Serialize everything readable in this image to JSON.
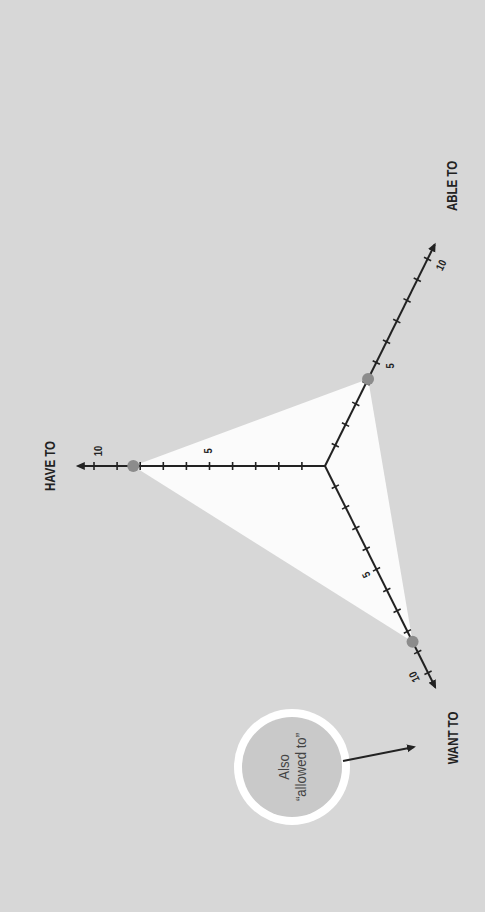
{
  "diagram": {
    "orientation": "rotated -90deg (page is sideways)",
    "background_color": "#d7d7d7",
    "triangle_fill": "#fbfbfb",
    "axis_color": "#222222",
    "point_color": "#8c8c8c",
    "center": [
      325,
      466
    ],
    "px_per_unit": 23.1,
    "axes": [
      {
        "id": "have_to",
        "label": "HAVE TO",
        "direction": [
          -1,
          0
        ],
        "max": 10,
        "value": 8.3,
        "tick_labels": [
          "5",
          "10"
        ]
      },
      {
        "id": "able_to",
        "label": "ABLE TO",
        "direction": [
          0.444,
          -0.896
        ],
        "max": 10,
        "value": 4.2,
        "tick_labels": [
          "5",
          "10"
        ]
      },
      {
        "id": "want_to",
        "label": "WANT TO",
        "direction": [
          0.446,
          0.895
        ],
        "max": 10,
        "value": 8.5,
        "tick_labels": [
          "5",
          "10"
        ]
      }
    ],
    "annotation": {
      "line1": "Also",
      "line2": "“allowed to”",
      "points_to": "WANT TO",
      "circle_fill": "#c9c9c9",
      "ring_color": "#ffffff"
    }
  },
  "chart_data": {
    "type": "radar",
    "title": "",
    "categories": [
      "HAVE TO",
      "ABLE TO",
      "WANT TO"
    ],
    "values": [
      8.3,
      4.2,
      8.5
    ],
    "range": [
      0,
      10
    ],
    "tick_labels": [
      5,
      10
    ],
    "annotations": [
      {
        "text": "Also “allowed to”",
        "target": "WANT TO"
      }
    ]
  }
}
